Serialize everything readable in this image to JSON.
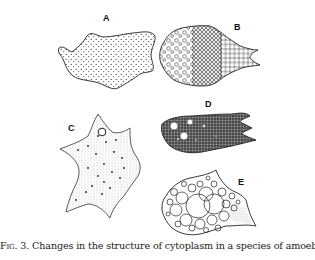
{
  "figure": {
    "panels": [
      {
        "label": "A",
        "description": "Amoeba with evenly distributed fine granules"
      },
      {
        "label": "B",
        "description": "Amoeba with vesicles grading from sparse to dense honeycomb network"
      },
      {
        "label": "C",
        "description": "Star-shaped amoeba with fine stippled cytoplasm, dark granules and one vacuole"
      },
      {
        "label": "D",
        "description": "Dark, densely granular amoeba with several clear vacuoles"
      },
      {
        "label": "E",
        "description": "Amoeba filled with large foamy vacuoles"
      }
    ],
    "caption": {
      "fig_label": "Fig. 3.",
      "text": " Changes in the structure of cytoplasm in a species of amoeba."
    }
  }
}
